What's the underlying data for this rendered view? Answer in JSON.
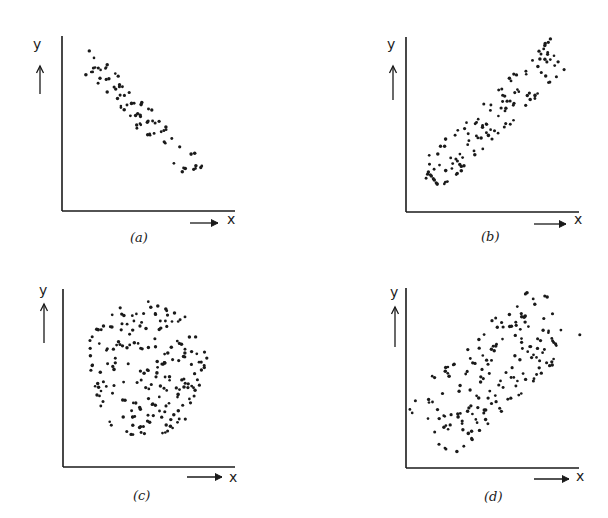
{
  "figure": {
    "panels": [
      {
        "id": "a",
        "caption": "(a)",
        "x_label": "x",
        "y_label": "y",
        "pattern": "strong negative correlation"
      },
      {
        "id": "b",
        "caption": "(b)",
        "x_label": "x",
        "y_label": "y",
        "pattern": "strong positive correlation"
      },
      {
        "id": "c",
        "caption": "(c)",
        "x_label": "x",
        "y_label": "y",
        "pattern": "no correlation"
      },
      {
        "id": "d",
        "caption": "(d)",
        "x_label": "x",
        "y_label": "y",
        "pattern": "moderate positive correlation"
      }
    ]
  },
  "chart_data": [
    {
      "type": "scatter",
      "title": "(a)",
      "xlabel": "x",
      "ylabel": "y",
      "grid": false,
      "description": "Narrow elongated band of ~75 points running from upper-left to lower-right (negative correlation)",
      "band": {
        "start": [
          0.12,
          0.88
        ],
        "end": [
          0.78,
          0.22
        ],
        "width": 0.14
      },
      "n_points": 75
    },
    {
      "type": "scatter",
      "title": "(b)",
      "xlabel": "x",
      "ylabel": "y",
      "grid": false,
      "description": "Elongated band of ~120 points running from lower-left to upper-right (positive correlation)",
      "band": {
        "start": [
          0.12,
          0.18
        ],
        "end": [
          0.9,
          0.92
        ],
        "width": 0.2
      },
      "n_points": 120
    },
    {
      "type": "scatter",
      "title": "(c)",
      "xlabel": "x",
      "ylabel": "y",
      "grid": false,
      "description": "Roughly circular cloud of ~200 points (no correlation)",
      "cloud": {
        "center": [
          0.48,
          0.55
        ],
        "radius": 0.38
      },
      "n_points": 200
    },
    {
      "type": "scatter",
      "title": "(d)",
      "xlabel": "x",
      "ylabel": "y",
      "grid": false,
      "description": "Broad elliptical cloud of ~170 points tilted lower-left to upper-right (weak/moderate positive correlation)",
      "band": {
        "start": [
          0.12,
          0.2
        ],
        "end": [
          0.88,
          0.88
        ],
        "width": 0.42
      },
      "n_points": 170
    }
  ]
}
